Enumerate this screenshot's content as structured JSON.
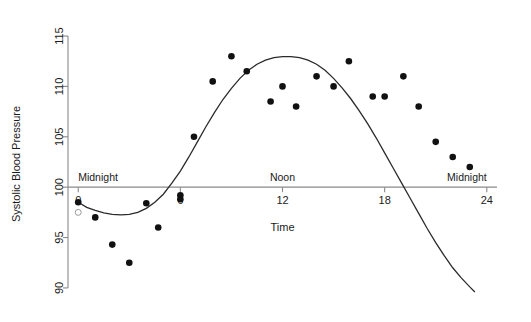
{
  "chart_data": {
    "type": "scatter",
    "title": "",
    "xlabel": "Time",
    "ylabel": "Systolic Blood Pressure",
    "xlim": [
      -0.6,
      24.6
    ],
    "ylim": [
      89.0,
      115.6
    ],
    "xticks": [
      0,
      6,
      12,
      18,
      24
    ],
    "xtick_labels": [
      "0",
      "6",
      "12",
      "18",
      "24"
    ],
    "yticks": [
      90,
      95,
      100,
      105,
      110,
      115
    ],
    "ytick_labels": [
      "90",
      "95",
      "100",
      "105",
      "110",
      "115"
    ],
    "grid": false,
    "legend": "none",
    "annotations": [
      {
        "text": "Midnight",
        "x": 0.0,
        "y": 100.0,
        "align": "left"
      },
      {
        "text": "Noon",
        "x": 12.0,
        "y": 100.0,
        "align": "center"
      },
      {
        "text": "Midnight",
        "x": 24.0,
        "y": 100.0,
        "align": "right"
      }
    ],
    "reference_line": {
      "y": 100,
      "label": "baseline-100"
    },
    "series": [
      {
        "name": "Observed systolic blood pressure",
        "marker": "filled-circle",
        "x": [
          0.0,
          1.0,
          2.0,
          3.0,
          4.0,
          4.7,
          6.0,
          6.0,
          6.8,
          7.9,
          9.0,
          9.9,
          11.3,
          12.0,
          12.8,
          14.0,
          15.0,
          15.9,
          17.3,
          18.0,
          19.1,
          20.0,
          21.0,
          22.0,
          23.0
        ],
        "y": [
          98.5,
          97.0,
          94.3,
          92.5,
          98.4,
          96.0,
          99.2,
          98.8,
          105.0,
          110.5,
          113.0,
          111.5,
          108.5,
          110.0,
          108.0,
          111.0,
          110.0,
          112.5,
          109.0,
          109.0,
          111.0,
          108.0,
          104.5,
          103.0,
          102.0
        ]
      },
      {
        "name": "Excluded observation",
        "marker": "open-circle",
        "x": [
          0.0
        ],
        "y": [
          97.5
        ]
      }
    ],
    "fitted_curve": {
      "name": "Fitted cosinor curve",
      "x": [
        0.0,
        0.5,
        1.0,
        1.5,
        2.0,
        2.5,
        3.0,
        3.5,
        4.0,
        4.5,
        5.0,
        5.5,
        6.0,
        6.5,
        7.0,
        7.5,
        8.0,
        8.5,
        9.0,
        9.5,
        10.0,
        10.5,
        11.0,
        11.5,
        12.0,
        12.5,
        13.0,
        13.5,
        14.0,
        14.5,
        15.0,
        15.5,
        16.0,
        16.5,
        17.0,
        17.5,
        18.0,
        18.5,
        19.0,
        19.5,
        20.0,
        20.5,
        21.0,
        21.5,
        22.0,
        22.5,
        23.0,
        23.3
      ],
      "y": [
        98.5,
        98.0,
        97.7,
        97.45,
        97.3,
        97.25,
        97.3,
        97.5,
        97.9,
        98.5,
        99.3,
        100.4,
        101.6,
        103.0,
        104.5,
        106.0,
        107.4,
        108.7,
        109.8,
        110.8,
        111.6,
        112.2,
        112.6,
        112.85,
        112.95,
        112.95,
        112.85,
        112.6,
        112.2,
        111.6,
        110.8,
        109.85,
        108.8,
        107.6,
        106.3,
        104.9,
        103.4,
        101.9,
        100.4,
        98.9,
        97.4,
        95.9,
        94.5,
        93.2,
        92.0,
        91.0,
        90.1,
        89.6
      ]
    }
  }
}
